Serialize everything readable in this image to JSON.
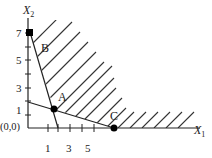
{
  "diagram": {
    "type": "linear-programming-feasible-region",
    "axes": {
      "x_label": "X",
      "x_sub": "1",
      "y_label": "X",
      "y_sub": "2",
      "origin_label": "(0,0)"
    },
    "y_ticks": [
      "7",
      "5",
      "3",
      "1"
    ],
    "x_ticks": [
      "1",
      "3",
      "5"
    ],
    "points": [
      {
        "label": "B",
        "coords": [
          0,
          7
        ]
      },
      {
        "label": "A",
        "coords": [
          1.5,
          1.5
        ]
      },
      {
        "label": "C",
        "coords": [
          7,
          0
        ]
      }
    ],
    "colors": {
      "line": "#222222",
      "hatch": "#333333",
      "point": "#000000"
    }
  }
}
